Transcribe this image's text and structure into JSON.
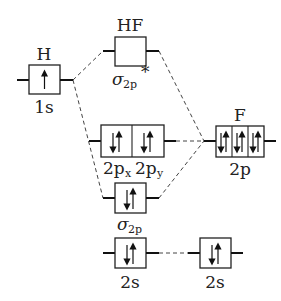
{
  "diagram": {
    "type": "molecular-orbital-diagram",
    "molecule": "HF",
    "left_atom": {
      "label": "H",
      "orbital": {
        "label": "1s",
        "electrons": [
          "up"
        ]
      }
    },
    "right_atom": {
      "label": "F",
      "orbitals": [
        {
          "label": "2p",
          "boxes": [
            [
              "down",
              "up"
            ],
            [
              "down",
              "up"
            ],
            [
              "down",
              "up"
            ]
          ]
        },
        {
          "label": "2s",
          "boxes": [
            [
              "down",
              "up"
            ]
          ]
        }
      ]
    },
    "molecular_orbitals": [
      {
        "label": "σ",
        "sub": "2p",
        "sup": "*",
        "title": "HF",
        "electrons": []
      },
      {
        "labels": [
          "2p",
          "2p"
        ],
        "subs": [
          "x",
          "y"
        ],
        "boxes": [
          [
            "down",
            "up"
          ],
          [
            "down",
            "up"
          ]
        ]
      },
      {
        "label": "σ",
        "sub": "2p",
        "electrons": [
          "down",
          "up"
        ]
      },
      {
        "label": "2s",
        "electrons": [
          "down",
          "up"
        ]
      }
    ],
    "texts": {
      "h_title": "H",
      "h_orb": "1s",
      "hf_title": "HF",
      "sigma_star_sym": "σ",
      "sigma_star_sub": "2p",
      "sigma_star_sup": "*",
      "px_main": "2p",
      "px_sub": "x",
      "py_main": "2p",
      "py_sub": "y",
      "sigma_sym": "σ",
      "sigma_sub": "2p",
      "mo_2s": "2s",
      "f_title": "F",
      "f_2p": "2p",
      "f_2s": "2s"
    }
  }
}
